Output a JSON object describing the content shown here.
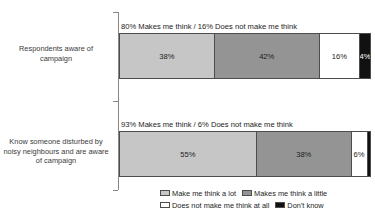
{
  "chart_data": {
    "type": "bar",
    "subtype": "stacked-horizontal-100pct",
    "title": "",
    "xlabel": "",
    "ylabel": "",
    "xlim": [
      0,
      100
    ],
    "grid": false,
    "legend_position": "bottom-right",
    "categories": [
      "Respondents aware of campaign",
      "Know someone disturbed by noisy neighbours and are aware of campaign"
    ],
    "series": [
      {
        "name": "Make me think a lot",
        "color": "#c6c6c6",
        "values": [
          38,
          55
        ],
        "labels": [
          "38%",
          "55%"
        ]
      },
      {
        "name": "Makes me think a little",
        "color": "#949494",
        "values": [
          42,
          38
        ],
        "labels": [
          "42%",
          "38%"
        ]
      },
      {
        "name": "Does not make me think at all",
        "color": "#ffffff",
        "values": [
          16,
          6
        ],
        "labels": [
          "16%",
          "6%"
        ]
      },
      {
        "name": "Don't know",
        "color": "#111111",
        "values": [
          4,
          1
        ],
        "labels": [
          "4%",
          ""
        ]
      }
    ],
    "annotations": [
      "80% Makes me think / 16% Does not make me think",
      "93% Makes me think / 6% Does not make me think"
    ]
  },
  "axis": {
    "line_color": "#888888"
  },
  "legend": {
    "items": [
      {
        "label": "Make me think a lot",
        "color": "#c6c6c6"
      },
      {
        "label": "Makes me think a little",
        "color": "#949494"
      },
      {
        "label": "Does not make me think at all",
        "color": "#ffffff"
      },
      {
        "label": "Don't know",
        "color": "#111111"
      }
    ]
  }
}
